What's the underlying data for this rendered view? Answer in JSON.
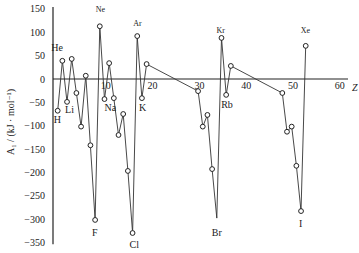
{
  "chart_data": {
    "type": "line",
    "title": "",
    "xlabel": "Z",
    "ylabel": "A₁ / (kJ · mol⁻¹)",
    "xlim": [
      0,
      62
    ],
    "ylim": [
      -350,
      150
    ],
    "grid": false,
    "legend": null,
    "x_ticks": [
      10,
      20,
      30,
      40,
      50,
      60
    ],
    "y_ticks": [
      150,
      100,
      50,
      0,
      -50,
      -100,
      -150,
      -200,
      -250,
      -300,
      -350
    ],
    "series": [
      {
        "name": "first electron affinity",
        "marker": "open-circle",
        "points": [
          {
            "z": 1,
            "y": -68,
            "label": "H"
          },
          {
            "z": 2,
            "y": 39,
            "label": "He"
          },
          {
            "z": 3,
            "y": -49,
            "label": "Li"
          },
          {
            "z": 4,
            "y": 43
          },
          {
            "z": 5,
            "y": -30
          },
          {
            "z": 6,
            "y": -102
          },
          {
            "z": 7,
            "y": 7
          },
          {
            "z": 8,
            "y": -142
          },
          {
            "z": 9,
            "y": -302,
            "label": "F"
          },
          {
            "z": 10,
            "y": 113,
            "label": "Ne"
          },
          {
            "z": 11,
            "y": -43,
            "label": "Na"
          },
          {
            "z": 12,
            "y": 34
          },
          {
            "z": 13,
            "y": -41
          },
          {
            "z": 14,
            "y": -120
          },
          {
            "z": 15,
            "y": -75
          },
          {
            "z": 16,
            "y": -197
          },
          {
            "z": 17,
            "y": -330,
            "label": "Cl"
          },
          {
            "z": 18,
            "y": 92,
            "label": "Ar"
          },
          {
            "z": 19,
            "y": -41,
            "label": "K"
          },
          {
            "z": 20,
            "y": 32
          },
          {
            "z": 31,
            "y": -26
          },
          {
            "z": 32,
            "y": -102
          },
          {
            "z": 33,
            "y": -77
          },
          {
            "z": 34,
            "y": -193
          },
          {
            "z": 35,
            "y": -298,
            "label": "Br"
          },
          {
            "z": 36,
            "y": 88,
            "label": "Kr"
          },
          {
            "z": 37,
            "y": -34,
            "label": "Rb"
          },
          {
            "z": 38,
            "y": 28
          },
          {
            "z": 49,
            "y": -30
          },
          {
            "z": 50,
            "y": -113
          },
          {
            "z": 51,
            "y": -102
          },
          {
            "z": 52,
            "y": -186
          },
          {
            "z": 53,
            "y": -283,
            "label": "I"
          },
          {
            "z": 54,
            "y": 71,
            "label": "Xe"
          }
        ]
      }
    ]
  },
  "labels": {
    "x_axis_title": "Z",
    "y_axis_title": "A₁ / (kJ · mol⁻¹)"
  }
}
